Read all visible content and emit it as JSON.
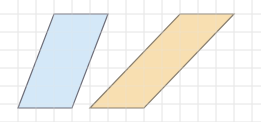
{
  "diagram": {
    "grid_unit": 1,
    "shapes": [
      {
        "name": "blue-parallelogram",
        "fill": "#cfe5f7",
        "stroke": "#6f6f7a",
        "vertices": [
          [
            1,
            5
          ],
          [
            4,
            5
          ],
          [
            6,
            0
          ],
          [
            3,
            0
          ]
        ]
      },
      {
        "name": "orange-parallelogram",
        "fill": "#f7dca8",
        "stroke": "#8a8070",
        "vertices": [
          [
            5,
            5
          ],
          [
            8,
            5
          ],
          [
            13,
            0
          ],
          [
            10,
            0
          ]
        ]
      }
    ],
    "grid_color": "#e8e8e8"
  }
}
